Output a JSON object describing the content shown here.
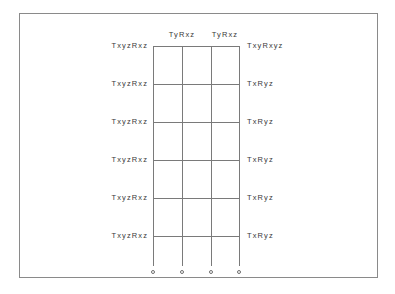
{
  "figure": {
    "background_color": "#ffffff",
    "frame_color": "#8a8a8a",
    "line_color": "#7a7a7a",
    "text_color": "#3a3a3a"
  },
  "diagram": {
    "type": "labeled-grid",
    "columns": 3,
    "rows": 6,
    "vertical_line_count": 4,
    "horizontal_line_count": 6,
    "column_top_labels": [
      {
        "label": "TyRxz"
      },
      {
        "label": "TyRxz"
      }
    ],
    "rows_data": [
      {
        "left": "TxyzRxz",
        "right": "TxyRxyz"
      },
      {
        "left": "TxyzRxz",
        "right": "TxRyz"
      },
      {
        "left": "TxyzRxz",
        "right": "TxRyz"
      },
      {
        "left": "TxyzRxz",
        "right": "TxRyz"
      },
      {
        "left": "TxyzRxz",
        "right": "TxRyz"
      },
      {
        "left": "TxyzRxz",
        "right": "TxRyz"
      }
    ],
    "bottom_markers": [
      {
        "label": ""
      },
      {
        "label": ""
      },
      {
        "label": ""
      },
      {
        "label": ""
      }
    ]
  }
}
